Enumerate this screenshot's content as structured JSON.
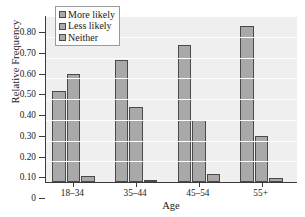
{
  "chart_data": {
    "type": "bar",
    "title": "",
    "xlabel": "Age",
    "ylabel": "Relative Frequency",
    "categories": [
      "18–34",
      "35–44",
      "45–54",
      "55+"
    ],
    "series": [
      {
        "name": "More likely",
        "values": [
          0.44,
          0.59,
          0.66,
          0.75
        ],
        "color": "#a9a9a9"
      },
      {
        "name": "Less likely",
        "values": [
          0.52,
          0.36,
          0.3,
          0.22
        ],
        "color": "#a9a9a9"
      },
      {
        "name": "Neither",
        "values": [
          0.03,
          0.01,
          0.04,
          0.02
        ],
        "color": "#a9a9a9"
      }
    ],
    "ylim": [
      0,
      0.8
    ],
    "ytick_values": [
      0,
      0.1,
      0.2,
      0.3,
      0.4,
      0.5,
      0.6,
      0.7,
      0.8
    ],
    "ytick_labels": [
      "0",
      "0.10",
      "0.20",
      "0.30",
      "0.40",
      "0.50",
      "0.60",
      "0.70",
      "0.80"
    ],
    "grid": "horizontal",
    "legend_position": "top-left-inside",
    "plot_background": "#efefef",
    "gridline_color": "#ffffff",
    "axis_color": "#3a3a3a",
    "bar_edge_color": "#4a4a4a"
  },
  "legend": {
    "items": [
      {
        "label": "More likely"
      },
      {
        "label": "Less likely"
      },
      {
        "label": "Neither"
      }
    ]
  },
  "axes": {
    "y_title": "Relative Frequency",
    "x_title": "Age"
  }
}
